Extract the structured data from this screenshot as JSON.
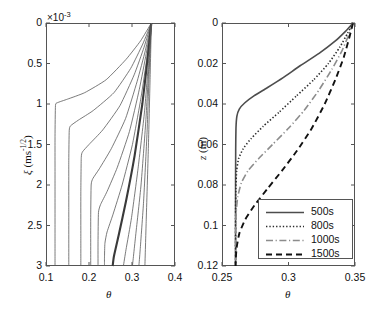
{
  "figure": {
    "background": "#ffffff",
    "panels": 2
  },
  "chart_data": [
    {
      "type": "line",
      "id": "left-panel",
      "title": "",
      "xlabel": "θ",
      "ylabel": "ξ (ms^-1/2)",
      "y_multiplier": "×10",
      "y_multiplier_exp": "-3",
      "xlim": [
        0.1,
        0.4
      ],
      "ylim": [
        0,
        3
      ],
      "y_inverted": true,
      "xticks": [
        0.1,
        0.2,
        0.3,
        0.4
      ],
      "xticklabels": [
        "0.1",
        "0.2",
        "0.3",
        "0.4"
      ],
      "yticks": [
        0,
        0.5,
        1,
        1.5,
        2,
        2.5,
        3
      ],
      "yticklabels": [
        "0",
        "0.5",
        "1",
        "1.5",
        "2",
        "2.5",
        "3"
      ],
      "grid": false,
      "legend": "none",
      "series": [
        {
          "name": "curve-1",
          "color": "#595959",
          "width": 0.8,
          "points": [
            [
              0.345,
              0.0
            ],
            [
              0.32,
              0.22
            ],
            [
              0.286,
              0.45
            ],
            [
              0.24,
              0.7
            ],
            [
              0.19,
              0.86
            ],
            [
              0.15,
              0.94
            ],
            [
              0.126,
              0.985
            ],
            [
              0.122,
              1.02
            ],
            [
              0.121,
              1.4
            ],
            [
              0.121,
              2.0
            ],
            [
              0.121,
              2.6
            ],
            [
              0.121,
              3.0
            ]
          ]
        },
        {
          "name": "curve-2",
          "color": "#595959",
          "width": 0.8,
          "points": [
            [
              0.345,
              0.0
            ],
            [
              0.325,
              0.26
            ],
            [
              0.297,
              0.56
            ],
            [
              0.258,
              0.86
            ],
            [
              0.21,
              1.08
            ],
            [
              0.175,
              1.2
            ],
            [
              0.157,
              1.27
            ],
            [
              0.154,
              1.33
            ],
            [
              0.153,
              1.7
            ],
            [
              0.153,
              2.3
            ],
            [
              0.153,
              3.0
            ]
          ]
        },
        {
          "name": "curve-3",
          "color": "#595959",
          "width": 0.8,
          "points": [
            [
              0.345,
              0.0
            ],
            [
              0.328,
              0.3
            ],
            [
              0.305,
              0.64
            ],
            [
              0.272,
              1.02
            ],
            [
              0.232,
              1.32
            ],
            [
              0.2,
              1.5
            ],
            [
              0.185,
              1.59
            ],
            [
              0.182,
              1.66
            ],
            [
              0.181,
              2.1
            ],
            [
              0.181,
              2.6
            ],
            [
              0.181,
              3.0
            ]
          ]
        },
        {
          "name": "curve-4",
          "color": "#595959",
          "width": 0.8,
          "points": [
            [
              0.345,
              0.0
            ],
            [
              0.331,
              0.34
            ],
            [
              0.312,
              0.72
            ],
            [
              0.285,
              1.18
            ],
            [
              0.252,
              1.55
            ],
            [
              0.224,
              1.8
            ],
            [
              0.209,
              1.92
            ],
            [
              0.205,
              2.0
            ],
            [
              0.204,
              2.4
            ],
            [
              0.204,
              3.0
            ]
          ]
        },
        {
          "name": "curve-5",
          "color": "#595959",
          "width": 0.8,
          "points": [
            [
              0.345,
              0.0
            ],
            [
              0.333,
              0.38
            ],
            [
              0.317,
              0.82
            ],
            [
              0.294,
              1.34
            ],
            [
              0.266,
              1.78
            ],
            [
              0.242,
              2.08
            ],
            [
              0.227,
              2.24
            ],
            [
              0.222,
              2.34
            ],
            [
              0.221,
              2.7
            ],
            [
              0.221,
              3.0
            ]
          ]
        },
        {
          "name": "curve-6",
          "color": "#595959",
          "width": 0.8,
          "points": [
            [
              0.345,
              0.0
            ],
            [
              0.335,
              0.42
            ],
            [
              0.321,
              0.92
            ],
            [
              0.301,
              1.5
            ],
            [
              0.277,
              2.0
            ],
            [
              0.256,
              2.36
            ],
            [
              0.242,
              2.58
            ],
            [
              0.237,
              2.72
            ],
            [
              0.236,
              2.9
            ],
            [
              0.236,
              3.0
            ]
          ]
        },
        {
          "name": "curve-7-thick",
          "color": "#3a3a3a",
          "width": 2.1,
          "points": [
            [
              0.345,
              0.0
            ],
            [
              0.336,
              0.45
            ],
            [
              0.324,
              1.0
            ],
            [
              0.306,
              1.64
            ],
            [
              0.286,
              2.2
            ],
            [
              0.269,
              2.62
            ],
            [
              0.258,
              2.88
            ],
            [
              0.255,
              3.0
            ]
          ]
        },
        {
          "name": "curve-8",
          "color": "#595959",
          "width": 0.8,
          "points": [
            [
              0.345,
              0.0
            ],
            [
              0.338,
              0.5
            ],
            [
              0.329,
              1.1
            ],
            [
              0.314,
              1.8
            ],
            [
              0.299,
              2.4
            ],
            [
              0.286,
              2.8
            ],
            [
              0.28,
              3.0
            ]
          ]
        },
        {
          "name": "curve-9",
          "color": "#595959",
          "width": 0.8,
          "points": [
            [
              0.345,
              0.0
            ],
            [
              0.339,
              0.55
            ],
            [
              0.332,
              1.22
            ],
            [
              0.321,
              2.0
            ],
            [
              0.309,
              2.6
            ],
            [
              0.301,
              3.0
            ]
          ]
        },
        {
          "name": "curve-10",
          "color": "#595959",
          "width": 0.8,
          "points": [
            [
              0.345,
              0.0
            ],
            [
              0.34,
              0.6
            ],
            [
              0.335,
              1.35
            ],
            [
              0.327,
              2.2
            ],
            [
              0.319,
              2.8
            ],
            [
              0.316,
              3.0
            ]
          ]
        },
        {
          "name": "curve-11",
          "color": "#595959",
          "width": 0.8,
          "points": [
            [
              0.345,
              0.0
            ],
            [
              0.342,
              0.7
            ],
            [
              0.338,
              1.55
            ],
            [
              0.333,
              2.45
            ],
            [
              0.33,
              3.0
            ]
          ]
        }
      ]
    },
    {
      "type": "line",
      "id": "right-panel",
      "title": "",
      "xlabel": "θ",
      "ylabel": "z (m)",
      "xlim": [
        0.25,
        0.35
      ],
      "ylim": [
        0,
        0.12
      ],
      "y_inverted": true,
      "xticks": [
        0.25,
        0.3,
        0.35
      ],
      "xticklabels": [
        "0.25",
        "0.3",
        "0.35"
      ],
      "yticks": [
        0,
        0.02,
        0.04,
        0.06,
        0.08,
        0.1,
        0.12
      ],
      "yticklabels": [
        "0",
        "0.02",
        "0.04",
        "0.06",
        "0.08",
        "0.1",
        "0.12"
      ],
      "grid": false,
      "legend_position": "lower right",
      "series": [
        {
          "name": "500s",
          "style": "solid",
          "color": "#4d4d4d",
          "width": 1.6,
          "points": [
            [
              0.3485,
              0.0
            ],
            [
              0.343,
              0.004
            ],
            [
              0.335,
              0.009
            ],
            [
              0.323,
              0.015
            ],
            [
              0.309,
              0.021
            ],
            [
              0.296,
              0.027
            ],
            [
              0.284,
              0.032
            ],
            [
              0.274,
              0.036
            ],
            [
              0.267,
              0.0395
            ],
            [
              0.263,
              0.0425
            ],
            [
              0.2612,
              0.046
            ],
            [
              0.2605,
              0.052
            ],
            [
              0.2603,
              0.062
            ],
            [
              0.2602,
              0.08
            ],
            [
              0.2602,
              0.1
            ],
            [
              0.2602,
              0.12
            ]
          ]
        },
        {
          "name": "800s",
          "style": "dotted",
          "color": "#2b2b2b",
          "width": 1.6,
          "points": [
            [
              0.3485,
              0.0
            ],
            [
              0.3445,
              0.005
            ],
            [
              0.3385,
              0.012
            ],
            [
              0.33,
              0.02
            ],
            [
              0.319,
              0.028
            ],
            [
              0.306,
              0.036
            ],
            [
              0.293,
              0.044
            ],
            [
              0.281,
              0.051
            ],
            [
              0.272,
              0.057
            ],
            [
              0.266,
              0.062
            ],
            [
              0.2625,
              0.067
            ],
            [
              0.261,
              0.073
            ],
            [
              0.2604,
              0.082
            ],
            [
              0.2602,
              0.095
            ],
            [
              0.2602,
              0.11
            ],
            [
              0.2602,
              0.12
            ]
          ]
        },
        {
          "name": "1000s",
          "style": "dashdot",
          "color": "#8c8c8c",
          "width": 1.6,
          "points": [
            [
              0.3485,
              0.0
            ],
            [
              0.3452,
              0.006
            ],
            [
              0.34,
              0.014
            ],
            [
              0.3325,
              0.023
            ],
            [
              0.323,
              0.033
            ],
            [
              0.312,
              0.043
            ],
            [
              0.3,
              0.052
            ],
            [
              0.288,
              0.06
            ],
            [
              0.2775,
              0.067
            ],
            [
              0.2695,
              0.073
            ],
            [
              0.2645,
              0.079
            ],
            [
              0.2618,
              0.086
            ],
            [
              0.2606,
              0.094
            ],
            [
              0.2602,
              0.104
            ],
            [
              0.2602,
              0.115
            ],
            [
              0.2602,
              0.12
            ]
          ]
        },
        {
          "name": "1500s",
          "style": "dashed",
          "color": "#111111",
          "width": 1.9,
          "points": [
            [
              0.3485,
              0.0
            ],
            [
              0.3458,
              0.007
            ],
            [
              0.3415,
              0.017
            ],
            [
              0.3352,
              0.028
            ],
            [
              0.3272,
              0.04
            ],
            [
              0.3175,
              0.052
            ],
            [
              0.3065,
              0.063
            ],
            [
              0.295,
              0.073
            ],
            [
              0.284,
              0.082
            ],
            [
              0.2745,
              0.09
            ],
            [
              0.2675,
              0.097
            ],
            [
              0.263,
              0.104
            ],
            [
              0.261,
              0.111
            ],
            [
              0.2603,
              0.117
            ],
            [
              0.2602,
              0.12
            ]
          ]
        }
      ]
    }
  ],
  "legend": {
    "entries": [
      {
        "label": "500s",
        "style": "solid"
      },
      {
        "label": "800s",
        "style": "dotted"
      },
      {
        "label": "1000s",
        "style": "dashdot"
      },
      {
        "label": "1500s",
        "style": "dashed"
      }
    ]
  },
  "left_axis": {
    "multiplier_prefix": "×10",
    "multiplier_exp": "-3",
    "xlabel": "θ",
    "ylabel_symbol": "ξ",
    "ylabel_unit_open": " (ms",
    "ylabel_unit_exp": "-1/2",
    "ylabel_unit_close": ")",
    "xticklabels": [
      "0.1",
      "0.2",
      "0.3",
      "0.4"
    ],
    "yticklabels": [
      "0",
      "0.5",
      "1",
      "1.5",
      "2",
      "2.5",
      "3"
    ]
  },
  "right_axis": {
    "xlabel": "θ",
    "ylabel_symbol": "z",
    "ylabel_unit": " (m)",
    "xticklabels": [
      "0.25",
      "0.3",
      "0.35"
    ],
    "yticklabels": [
      "0",
      "0.02",
      "0.04",
      "0.06",
      "0.08",
      "0.1",
      "0.12"
    ]
  }
}
